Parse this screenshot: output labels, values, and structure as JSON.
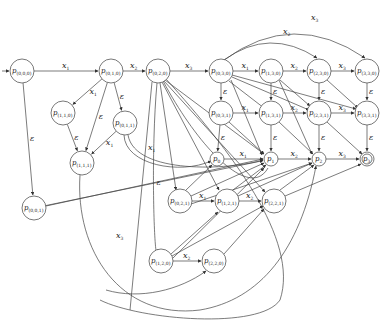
{
  "diagram": {
    "type": "state automaton",
    "start_node": "p(0,0,0)",
    "accept_node": "p3",
    "nodes": [
      {
        "id": "n000",
        "label": "p",
        "sub": "(0,0,0)",
        "x": 22,
        "y": 71,
        "r": 12
      },
      {
        "id": "n010",
        "label": "p",
        "sub": "(0,1,0)",
        "x": 111,
        "y": 71,
        "r": 12
      },
      {
        "id": "n020",
        "label": "p",
        "sub": "(0,2,0)",
        "x": 158,
        "y": 71,
        "r": 12
      },
      {
        "id": "n030",
        "label": "p",
        "sub": "(0,3,0)",
        "x": 221,
        "y": 71,
        "r": 12
      },
      {
        "id": "n130",
        "label": "p",
        "sub": "(1,3,0)",
        "x": 271,
        "y": 71,
        "r": 12
      },
      {
        "id": "n230",
        "label": "p",
        "sub": "(2,3,0)",
        "x": 319,
        "y": 71,
        "r": 12
      },
      {
        "id": "n330",
        "label": "p",
        "sub": "(3,3,0)",
        "x": 367,
        "y": 71,
        "r": 12
      },
      {
        "id": "n110",
        "label": "p",
        "sub": "(1,1,0)",
        "x": 63,
        "y": 113,
        "r": 12
      },
      {
        "id": "n011",
        "label": "p",
        "sub": "(0,1,1)",
        "x": 125,
        "y": 123,
        "r": 12
      },
      {
        "id": "n111",
        "label": "p",
        "sub": "(1,1,1)",
        "x": 82,
        "y": 163,
        "r": 12
      },
      {
        "id": "n031",
        "label": "p",
        "sub": "(0,3,1)",
        "x": 221,
        "y": 113,
        "r": 12
      },
      {
        "id": "n131",
        "label": "p",
        "sub": "(1,3,1)",
        "x": 271,
        "y": 113,
        "r": 12
      },
      {
        "id": "n231",
        "label": "p",
        "sub": "(2,3,1)",
        "x": 319,
        "y": 113,
        "r": 12
      },
      {
        "id": "n331",
        "label": "p",
        "sub": "(3,3,1)",
        "x": 367,
        "y": 113,
        "r": 12
      },
      {
        "id": "p0",
        "label": "p",
        "sub": "0",
        "x": 217,
        "y": 159,
        "r": 7
      },
      {
        "id": "p1",
        "label": "p",
        "sub": "1",
        "x": 271,
        "y": 159,
        "r": 7
      },
      {
        "id": "p2",
        "label": "p",
        "sub": "2",
        "x": 319,
        "y": 159,
        "r": 7
      },
      {
        "id": "p3",
        "label": "p",
        "sub": "3",
        "x": 367,
        "y": 159,
        "r": 7,
        "accepting": true
      },
      {
        "id": "n001",
        "label": "p",
        "sub": "(0,0,1)",
        "x": 34,
        "y": 208,
        "r": 12
      },
      {
        "id": "n021",
        "label": "p",
        "sub": "(0,2,1)",
        "x": 180,
        "y": 201,
        "r": 12
      },
      {
        "id": "n121",
        "label": "p",
        "sub": "(1,2,1)",
        "x": 227,
        "y": 201,
        "r": 12
      },
      {
        "id": "n221",
        "label": "p",
        "sub": "(2,2,1)",
        "x": 274,
        "y": 201,
        "r": 12
      },
      {
        "id": "n120",
        "label": "p",
        "sub": "(1,2,0)",
        "x": 161,
        "y": 261,
        "r": 12
      },
      {
        "id": "n220",
        "label": "p",
        "sub": "(2,2,0)",
        "x": 214,
        "y": 261,
        "r": 12
      }
    ],
    "edge_labels": {
      "x1": "x",
      "x1_sub": "1",
      "x2": "x",
      "x2_sub": "2",
      "x3": "x",
      "x3_sub": "3",
      "eps": "ε"
    },
    "edges": [
      {
        "from": "start",
        "to": "n000",
        "label": ""
      },
      {
        "from": "n000",
        "to": "n010",
        "label": "x1"
      },
      {
        "from": "n010",
        "to": "n020",
        "label": "x2"
      },
      {
        "from": "n020",
        "to": "n030",
        "label": "x3"
      },
      {
        "from": "n030",
        "to": "n130",
        "label": "x1"
      },
      {
        "from": "n130",
        "to": "n230",
        "label": "x2"
      },
      {
        "from": "n230",
        "to": "n330",
        "label": "x3"
      },
      {
        "from": "n030",
        "to": "n230",
        "label": "x2",
        "curved": true
      },
      {
        "from": "n030",
        "to": "n330",
        "label": "x3",
        "curved": true
      },
      {
        "from": "n031",
        "to": "n131",
        "label": "x1"
      },
      {
        "from": "n131",
        "to": "n231",
        "label": "x2"
      },
      {
        "from": "n231",
        "to": "n331",
        "label": "x3"
      },
      {
        "from": "p0",
        "to": "p1",
        "label": "x1"
      },
      {
        "from": "p1",
        "to": "p2",
        "label": "x2"
      },
      {
        "from": "p2",
        "to": "p3",
        "label": "x3"
      },
      {
        "from": "n021",
        "to": "n121",
        "label": "x1"
      },
      {
        "from": "n121",
        "to": "n221",
        "label": "x2"
      },
      {
        "from": "n120",
        "to": "n220",
        "label": "x2"
      },
      {
        "from": "n010",
        "to": "n110",
        "label": "x1"
      },
      {
        "from": "n011",
        "to": "n111",
        "label": "x1"
      },
      {
        "from": "n000",
        "to": "n001",
        "label": "eps"
      },
      {
        "from": "n010",
        "to": "n011",
        "label": "eps"
      },
      {
        "from": "n010",
        "to": "n111",
        "label": "eps"
      },
      {
        "from": "n110",
        "to": "n111",
        "label": "eps"
      },
      {
        "from": "n030",
        "to": "n031",
        "label": "eps"
      },
      {
        "from": "n130",
        "to": "n131",
        "label": "eps"
      },
      {
        "from": "n230",
        "to": "n231",
        "label": "eps"
      },
      {
        "from": "n330",
        "to": "n331",
        "label": "eps"
      },
      {
        "from": "n031",
        "to": "p0",
        "label": "eps"
      },
      {
        "from": "n131",
        "to": "p1",
        "label": "eps"
      },
      {
        "from": "n231",
        "to": "p2",
        "label": "eps"
      },
      {
        "from": "n331",
        "to": "p3",
        "label": "eps"
      },
      {
        "from": "n001",
        "to": "p1",
        "label": "eps"
      }
    ]
  }
}
